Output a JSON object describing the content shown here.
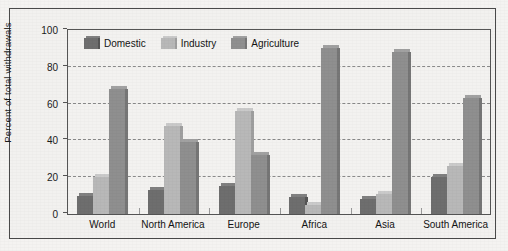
{
  "chart_data": {
    "type": "bar",
    "title": "",
    "xlabel": "",
    "ylabel": "Percent of total withdrawals",
    "ylim": [
      0,
      100
    ],
    "ytick_labels": [
      "0",
      "20",
      "40",
      "60",
      "80",
      "100"
    ],
    "yticks": [
      0,
      20,
      40,
      60,
      80,
      100
    ],
    "grid": true,
    "legend_position": "top-left inside plot",
    "categories": [
      "World",
      "North America",
      "Europe",
      "Africa",
      "Asia",
      "South America"
    ],
    "series": [
      {
        "name": "Domestic",
        "color": "#6e6e6e",
        "values": [
          10,
          13,
          15,
          9,
          8,
          20
        ]
      },
      {
        "name": "Industry",
        "color": "#b8b8b8",
        "values": [
          20,
          48,
          56,
          5,
          11,
          26
        ]
      },
      {
        "name": "Agriculture",
        "color": "#8f8f8f",
        "values": [
          68,
          39,
          32,
          90,
          88,
          63
        ]
      }
    ]
  },
  "legend": {
    "items": [
      {
        "label": "Domestic"
      },
      {
        "label": "Industry"
      },
      {
        "label": "Agriculture"
      }
    ]
  },
  "axes": {
    "y_title": "Percent of total withdrawals",
    "y_labels": [
      "100",
      "80",
      "60",
      "40",
      "20",
      "0"
    ],
    "x_labels": [
      "World",
      "North America",
      "Europe",
      "Africa",
      "Asia",
      "South America"
    ]
  },
  "colors": {
    "domestic": "#6e6e6e",
    "industry": "#b8b8b8",
    "agriculture": "#8f8f8f",
    "background": "#f3f2f0",
    "frame": "#4a4a4a",
    "gridline": "#8a8a8a"
  }
}
